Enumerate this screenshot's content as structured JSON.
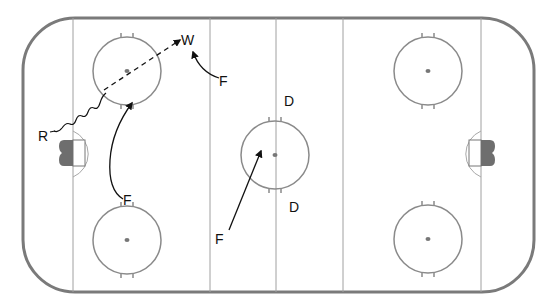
{
  "diagram": {
    "type": "hockey-rink-play",
    "colors": {
      "boards": "#7a7a7a",
      "lines": "#9a9a9a",
      "circles": "#8a8a8a",
      "goal": "#6e6e6e",
      "arrows": "#111111",
      "background": "#ffffff"
    },
    "labels": {
      "winger": "W",
      "forward_top": "F",
      "forward_left_bottom": "F",
      "forward_center": "F",
      "defense_top": "D",
      "defense_bottom": "D",
      "receiver": "R"
    },
    "players": [
      {
        "label": "W",
        "role": "wing",
        "position": [
          188,
          40
        ]
      },
      {
        "label": "F",
        "role": "forward",
        "position": [
          225,
          81
        ]
      },
      {
        "label": "F",
        "role": "forward",
        "position": [
          130,
          206
        ]
      },
      {
        "label": "F",
        "role": "forward",
        "position": [
          221,
          240
        ]
      },
      {
        "label": "D",
        "role": "defense",
        "position": [
          290,
          75
        ]
      },
      {
        "label": "D",
        "role": "defense",
        "position": [
          295,
          208
        ]
      },
      {
        "label": "R",
        "role": "receiver",
        "position": [
          42,
          136
        ]
      }
    ],
    "paths": [
      {
        "type": "pass",
        "style": "dashed-arrow",
        "from": "R",
        "to": "W"
      },
      {
        "type": "skate-with-puck",
        "style": "wavy",
        "from": "R",
        "to": "left-top-faceoff"
      },
      {
        "type": "skate",
        "style": "solid-arrow",
        "from": "F (right of W)",
        "to": "W"
      },
      {
        "type": "skate",
        "style": "solid-arrow",
        "from": "F (bottom-left)",
        "to": "left-top-faceoff"
      },
      {
        "type": "skate",
        "style": "solid-arrow",
        "from": "F (center-bottom)",
        "to": "center-faceoff"
      }
    ]
  }
}
